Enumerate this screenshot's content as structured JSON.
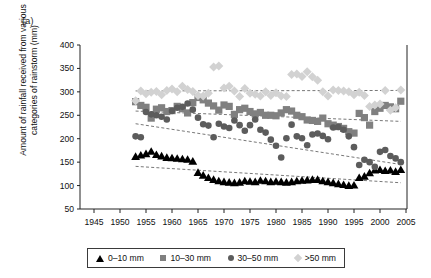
{
  "figure": {
    "panel_label": "(a)",
    "ylabel": "Amount of rainfall received from various categories of rainstorm (mm)"
  },
  "legend": {
    "position": "below-axes",
    "items": [
      {
        "label": "0–10 mm",
        "marker": "triangle-up-icon",
        "color": "#000000"
      },
      {
        "label": "10–30 mm",
        "marker": "square-icon",
        "color": "#808080"
      },
      {
        "label": "30–50 mm",
        "marker": "circle-icon",
        "color": "#5c5c5c"
      },
      {
        "label": ">50 mm",
        "marker": "diamond-icon",
        "color": "#d2d2d2"
      }
    ]
  },
  "chart_data": {
    "type": "scatter",
    "title": "",
    "xlabel": "",
    "ylabel": "Amount of rainfall received from various categories of rainstorm (mm)",
    "xlim": [
      1943,
      2005
    ],
    "ylim": [
      50,
      400
    ],
    "xticks": [
      1945,
      1950,
      1955,
      1960,
      1965,
      1970,
      1975,
      1980,
      1985,
      1990,
      1995,
      2000,
      2005
    ],
    "yticks": [
      50,
      100,
      150,
      200,
      250,
      300,
      350,
      400
    ],
    "grid": false,
    "legend_position": "bottom",
    "x": [
      1953,
      1954,
      1955,
      1956,
      1957,
      1958,
      1959,
      1960,
      1961,
      1962,
      1963,
      1964,
      1965,
      1966,
      1967,
      1968,
      1969,
      1970,
      1971,
      1972,
      1973,
      1974,
      1975,
      1976,
      1977,
      1978,
      1979,
      1980,
      1981,
      1982,
      1983,
      1984,
      1985,
      1986,
      1987,
      1988,
      1989,
      1990,
      1991,
      1992,
      1993,
      1994,
      1995,
      1996,
      1997,
      1998,
      1999,
      2000,
      2001,
      2002,
      2003,
      2004
    ],
    "series": [
      {
        "name": "0–10 mm",
        "marker": "triangle-up-icon",
        "color": "#000000",
        "size": 4.2,
        "values": [
          162,
          165,
          168,
          173,
          166,
          163,
          160,
          159,
          158,
          157,
          156,
          152,
          128,
          122,
          117,
          113,
          110,
          108,
          107,
          106,
          107,
          110,
          109,
          108,
          111,
          110,
          108,
          109,
          108,
          107,
          108,
          110,
          111,
          112,
          113,
          113,
          110,
          108,
          106,
          104,
          102,
          100,
          101,
          117,
          120,
          127,
          133,
          134,
          132,
          133,
          130,
          134
        ],
        "trend": {
          "type": "linear-dashed",
          "x": [
            1953,
            2004
          ],
          "y": [
            141,
            106
          ]
        }
      },
      {
        "name": "10–30 mm",
        "marker": "square-icon",
        "color": "#808080",
        "size": 3.6,
        "values": [
          279,
          271,
          267,
          244,
          263,
          266,
          258,
          260,
          269,
          264,
          255,
          277,
          288,
          283,
          276,
          270,
          261,
          272,
          269,
          252,
          262,
          265,
          258,
          253,
          256,
          250,
          250,
          249,
          255,
          262,
          259,
          250,
          247,
          240,
          239,
          237,
          244,
          232,
          229,
          226,
          222,
          215,
          212,
          254,
          245,
          229,
          258,
          265,
          271,
          268,
          264,
          280
        ],
        "trend": {
          "type": "linear-dashed",
          "x": [
            1953,
            2004
          ],
          "y": [
            259,
            237
          ]
        }
      },
      {
        "name": "30–50 mm",
        "marker": "circle-icon",
        "color": "#5c5c5c",
        "size": 3.3,
        "values": [
          205,
          203,
          257,
          252,
          250,
          247,
          241,
          259,
          266,
          268,
          275,
          262,
          245,
          231,
          228,
          203,
          232,
          226,
          223,
          239,
          229,
          217,
          229,
          241,
          219,
          213,
          198,
          185,
          160,
          201,
          230,
          205,
          201,
          186,
          209,
          211,
          206,
          199,
          224,
          225,
          219,
          205,
          182,
          144,
          155,
          150,
          140,
          172,
          176,
          163,
          158,
          150
        ],
        "trend": {
          "type": "linear-dashed",
          "x": [
            1953,
            2004
          ],
          "y": [
            232,
            145
          ]
        }
      },
      {
        "name": ">50 mm",
        "marker": "diamond-icon",
        "color": "#d2d2d2",
        "size": 3.6,
        "values": [
          281,
          302,
          296,
          299,
          301,
          294,
          303,
          306,
          300,
          312,
          305,
          301,
          292,
          291,
          297,
          353,
          355,
          308,
          312,
          302,
          290,
          307,
          297,
          295,
          291,
          300,
          292,
          298,
          291,
          290,
          337,
          338,
          333,
          343,
          332,
          325,
          300,
          291,
          304,
          303,
          302,
          300,
          294,
          299,
          292,
          269,
          272,
          274,
          303,
          261,
          266,
          304
        ],
        "trend": {
          "type": "linear-dashed",
          "x": [
            1953,
            2004
          ],
          "y": [
            302,
            303
          ]
        }
      }
    ]
  }
}
